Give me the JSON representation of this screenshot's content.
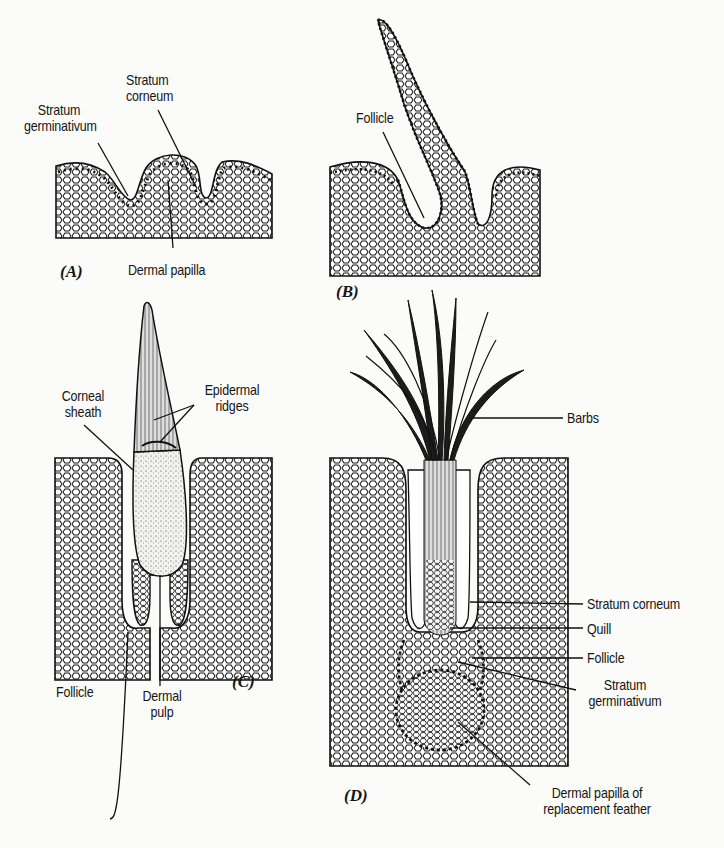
{
  "figure": {
    "panels": [
      {
        "id": "A",
        "label": "(A)",
        "annotations": {
          "stratum_germinativum": [
            "Stratum",
            "germinativum"
          ],
          "stratum_corneum": [
            "Stratum",
            "corneum"
          ],
          "dermal_papilla": "Dermal papilla"
        }
      },
      {
        "id": "B",
        "label": "(B)",
        "annotations": {
          "follicle": "Follicle"
        }
      },
      {
        "id": "C",
        "label": "(C)",
        "annotations": {
          "corneal_sheath": [
            "Corneal",
            "sheath"
          ],
          "epidermal_ridges": [
            "Epidermal",
            "ridges"
          ],
          "follicle": "Follicle",
          "dermal_pulp": [
            "Dermal",
            "pulp"
          ]
        }
      },
      {
        "id": "D",
        "label": "(D)",
        "annotations": {
          "barbs": "Barbs",
          "stratum_corneum": "Stratum corneum",
          "quill": "Quill",
          "follicle": "Follicle",
          "stratum_germinativum": [
            "Stratum",
            "germinativum"
          ],
          "dermal_papilla_replacement": [
            "Dermal papilla of",
            "replacement feather"
          ]
        }
      }
    ],
    "colors": {
      "ink": "#151515",
      "paper": "#fbfbf9",
      "tissue": "#ffffff"
    }
  }
}
